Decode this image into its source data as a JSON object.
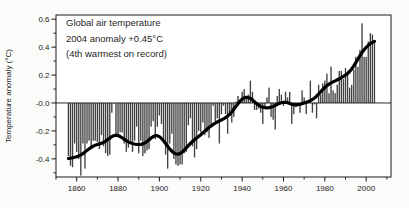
{
  "figure": {
    "title_lines": [
      "Global air temperature",
      "2004 anomaly +0.45°C",
      "(4th warmest on record)"
    ]
  },
  "chart_data": {
    "type": "bar",
    "title": "Global air temperature",
    "annotations": [
      "2004 anomaly +0.45°C",
      "(4th warmest on record)"
    ],
    "xlabel": "",
    "ylabel": "Temperature anomaly (°C)",
    "xlim": [
      1850,
      2012
    ],
    "ylim": [
      -0.53,
      0.63
    ],
    "x_ticks": [
      1860,
      1880,
      1900,
      1920,
      1940,
      1960,
      1980,
      2000
    ],
    "x_tick_labels": [
      "1860",
      "1880",
      "1900",
      "1920",
      "1940",
      "1960",
      "1980",
      "2000"
    ],
    "x_minor_ticks": [
      1850,
      1870,
      1890,
      1910,
      1930,
      1950,
      1970,
      1990,
      2010
    ],
    "y_ticks": [
      0.6,
      0.4,
      0.2,
      0.0,
      -0.2,
      -0.4
    ],
    "y_tick_labels": [
      "0.6",
      "0.4",
      "0.2",
      "-0.0",
      "-0.2",
      "-0.4"
    ],
    "y_minor_ticks": [
      0.5,
      0.3,
      0.1,
      -0.1,
      -0.3,
      -0.5
    ],
    "grid": false,
    "legend": "none",
    "bar_color": "#414141",
    "line_color": "#000000",
    "bar_series": {
      "name": "Annual temperature anomaly (°C)",
      "year_start": 1856,
      "year_end": 2004,
      "values": [
        -0.38,
        -0.45,
        -0.46,
        -0.29,
        -0.35,
        -0.4,
        -0.52,
        -0.29,
        -0.47,
        -0.29,
        -0.27,
        -0.32,
        -0.27,
        -0.27,
        -0.28,
        -0.33,
        -0.23,
        -0.31,
        -0.36,
        -0.38,
        -0.37,
        -0.07,
        0.0,
        -0.24,
        -0.24,
        -0.21,
        -0.21,
        -0.29,
        -0.35,
        -0.32,
        -0.27,
        -0.35,
        -0.27,
        -0.17,
        -0.36,
        -0.27,
        -0.38,
        -0.36,
        -0.34,
        -0.33,
        -0.17,
        -0.13,
        -0.26,
        -0.17,
        -0.09,
        -0.15,
        -0.28,
        -0.37,
        -0.47,
        -0.29,
        -0.22,
        -0.4,
        -0.44,
        -0.45,
        -0.44,
        -0.44,
        -0.36,
        -0.35,
        -0.16,
        -0.11,
        -0.31,
        -0.39,
        -0.33,
        -0.2,
        -0.21,
        -0.14,
        -0.23,
        -0.21,
        -0.25,
        -0.15,
        -0.02,
        -0.13,
        -0.11,
        -0.29,
        -0.08,
        -0.02,
        -0.08,
        -0.22,
        -0.08,
        -0.14,
        -0.1,
        0.01,
        0.05,
        0.02,
        0.08,
        0.1,
        0.05,
        0.06,
        0.16,
        0.08,
        -0.05,
        -0.05,
        -0.04,
        -0.07,
        -0.15,
        -0.04,
        0.04,
        0.11,
        -0.1,
        -0.12,
        -0.19,
        0.05,
        0.1,
        0.06,
        -0.02,
        0.08,
        0.04,
        0.08,
        -0.15,
        -0.08,
        -0.03,
        -0.02,
        -0.07,
        0.09,
        0.04,
        -0.08,
        0.01,
        0.16,
        -0.07,
        -0.01,
        -0.11,
        0.13,
        0.06,
        0.14,
        0.16,
        0.21,
        0.07,
        0.26,
        0.09,
        0.07,
        0.13,
        0.23,
        0.23,
        0.17,
        0.25,
        0.22,
        0.11,
        0.13,
        0.24,
        0.33,
        0.26,
        0.38,
        0.57,
        0.33,
        0.33,
        0.44,
        0.5,
        0.49,
        0.45
      ]
    },
    "line_series": {
      "name": "Smoothed anomaly (thick curve)",
      "derived_from": "binomial smoothing of annual values"
    }
  }
}
